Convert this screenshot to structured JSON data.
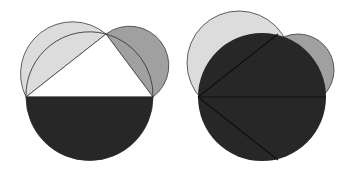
{
  "title": "Lune of Hippocrates — area comparison",
  "colors": {
    "background": "#ffffff",
    "light_gray": "#dcdcdc",
    "mid_gray": "#a0a0a0",
    "dark": "#272727",
    "stroke": "#3a3a3a",
    "triangle_fill": "#ffffff"
  },
  "figures": [
    {
      "name": "left-figure",
      "description": "Triangle inscribed in semicircle with semicircles on the two legs",
      "points": {
        "A": [
          26,
          97
        ],
        "B": [
          153,
          97
        ],
        "C": [
          106,
          34
        ]
      },
      "shapes": [
        "light semicircle on leg AC",
        "gray semicircle on leg CB",
        "dark semicircle below hypotenuse AB",
        "white triangle ABC"
      ]
    },
    {
      "name": "right-figure",
      "description": "Same construction with full dark circle overlapping the leg semicircles",
      "points": {
        "A": [
          198,
          97
        ],
        "B": [
          326,
          97
        ],
        "C": [
          278,
          34
        ],
        "D": [
          278,
          160
        ]
      },
      "shapes": [
        "light circle on leg AC",
        "gray circle on leg CB",
        "dark full circle on diameter AB",
        "chords AC, AB, AD"
      ]
    }
  ]
}
